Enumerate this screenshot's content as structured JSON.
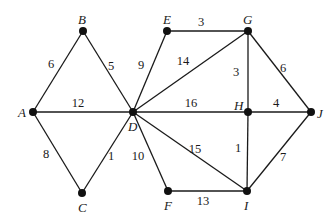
{
  "graph": {
    "type": "weighted-undirected",
    "nodes": [
      {
        "id": "A",
        "label": "A",
        "x": 33,
        "y": 112,
        "lx": 18,
        "ly": 117
      },
      {
        "id": "B",
        "label": "B",
        "x": 83,
        "y": 31,
        "lx": 78,
        "ly": 24
      },
      {
        "id": "C",
        "label": "C",
        "x": 82,
        "y": 193,
        "lx": 78,
        "ly": 212
      },
      {
        "id": "D",
        "label": "D",
        "x": 133,
        "y": 112,
        "lx": 128,
        "ly": 131
      },
      {
        "id": "E",
        "label": "E",
        "x": 167,
        "y": 31,
        "lx": 163,
        "ly": 24
      },
      {
        "id": "G",
        "label": "G",
        "x": 248,
        "y": 31,
        "lx": 243,
        "ly": 24
      },
      {
        "id": "H",
        "label": "H",
        "x": 248,
        "y": 112,
        "lx": 234,
        "ly": 110
      },
      {
        "id": "J",
        "label": "J",
        "x": 311,
        "y": 112,
        "lx": 317,
        "ly": 118
      },
      {
        "id": "F",
        "label": "F",
        "x": 168,
        "y": 191,
        "lx": 164,
        "ly": 210
      },
      {
        "id": "I",
        "label": "I",
        "x": 247,
        "y": 191,
        "lx": 244,
        "ly": 210
      }
    ],
    "edges": [
      {
        "from": "A",
        "to": "B",
        "weight": "6",
        "wx": 51,
        "wy": 68
      },
      {
        "from": "B",
        "to": "D",
        "weight": "5",
        "wx": 111,
        "wy": 70
      },
      {
        "from": "A",
        "to": "D",
        "weight": "12",
        "wx": 78,
        "wy": 107
      },
      {
        "from": "A",
        "to": "C",
        "weight": "8",
        "wx": 46,
        "wy": 158
      },
      {
        "from": "C",
        "to": "D",
        "weight": "1",
        "wx": 111,
        "wy": 160
      },
      {
        "from": "D",
        "to": "E",
        "weight": "9",
        "wx": 141,
        "wy": 69
      },
      {
        "from": "E",
        "to": "G",
        "weight": "3",
        "wx": 201,
        "wy": 26
      },
      {
        "from": "D",
        "to": "G",
        "weight": "14",
        "wx": 183,
        "wy": 65
      },
      {
        "from": "G",
        "to": "H",
        "weight": "3",
        "wx": 236,
        "wy": 76
      },
      {
        "from": "G",
        "to": "J",
        "weight": "6",
        "wx": 283,
        "wy": 72
      },
      {
        "from": "D",
        "to": "H",
        "weight": "16",
        "wx": 191,
        "wy": 107
      },
      {
        "from": "H",
        "to": "J",
        "weight": "4",
        "wx": 276,
        "wy": 107
      },
      {
        "from": "D",
        "to": "F",
        "weight": "10",
        "wx": 138,
        "wy": 160
      },
      {
        "from": "D",
        "to": "I",
        "weight": "15",
        "wx": 195,
        "wy": 153
      },
      {
        "from": "H",
        "to": "I",
        "weight": "1",
        "wx": 238,
        "wy": 152
      },
      {
        "from": "J",
        "to": "I",
        "weight": "7",
        "wx": 283,
        "wy": 161
      },
      {
        "from": "F",
        "to": "I",
        "weight": "13",
        "wx": 203,
        "wy": 205
      }
    ]
  }
}
